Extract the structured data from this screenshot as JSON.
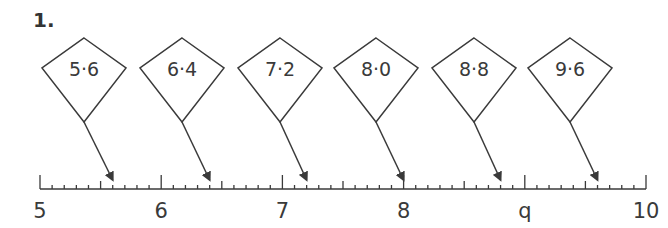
{
  "question": {
    "number": "1."
  },
  "kites": [
    {
      "label": "5·6",
      "value": 5.6
    },
    {
      "label": "6·4",
      "value": 6.4
    },
    {
      "label": "7·2",
      "value": 7.2
    },
    {
      "label": "8·0",
      "value": 8.0
    },
    {
      "label": "8·8",
      "value": 8.8
    },
    {
      "label": "9·6",
      "value": 9.6
    }
  ],
  "number_line": {
    "min": 5,
    "max": 10,
    "subdivisions_per_unit": 10,
    "labels": [
      "5",
      "6",
      "7",
      "8",
      "q",
      "10"
    ]
  },
  "colors": {
    "stroke": "#3a3a3a",
    "background": "#ffffff"
  }
}
